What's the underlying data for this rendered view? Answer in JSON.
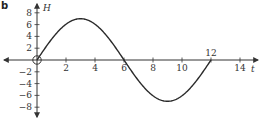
{
  "panel_label": "b",
  "colors": {
    "axis": "#333333",
    "curve": "#2a2a2a",
    "background": "#ffffff"
  },
  "chart_data": {
    "type": "line",
    "title": "",
    "xlabel": "t",
    "ylabel": "H",
    "xlim": [
      -2.2,
      15.5
    ],
    "ylim": [
      -9,
      9
    ],
    "grid": false,
    "legend": null,
    "x_ticks": [
      2,
      4,
      6,
      8,
      10,
      12,
      14
    ],
    "x_tick_labels": [
      "2",
      "4",
      "6",
      "8",
      "10",
      "12",
      "14"
    ],
    "y_ticks": [
      8,
      6,
      4,
      2,
      -2,
      -4,
      -6,
      -8
    ],
    "y_tick_labels": [
      "8",
      "6",
      "4",
      "2",
      "−2",
      "−4",
      "−6",
      "−8"
    ],
    "annotations": [
      "open circle at origin (0, 0)"
    ],
    "series": [
      {
        "name": "H(t) = 7 sin(πt/6)",
        "x": [
          0,
          1,
          2,
          3,
          4,
          5,
          6,
          7,
          8,
          9,
          10,
          11,
          12
        ],
        "values": [
          0,
          3.5,
          6.06,
          7,
          6.06,
          3.5,
          0,
          -3.5,
          -6.06,
          -7,
          -6.06,
          -3.5,
          0
        ]
      }
    ]
  }
}
